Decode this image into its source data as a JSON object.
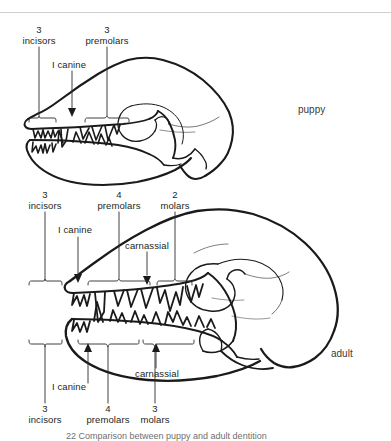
{
  "figure": {
    "top_rule_color": "#cfcfcf",
    "background_color": "#ffffff",
    "ink_color": "#1a1a1a"
  },
  "puppy": {
    "side_label": "puppy",
    "upper_labels": {
      "incisors_count": "3",
      "incisors_name": "incisors",
      "canine": "I canine",
      "premolars_count": "3",
      "premolars_name": "premolars"
    }
  },
  "adult": {
    "side_label": "adult",
    "upper_labels": {
      "incisors_count": "3",
      "incisors_name": "incisors",
      "canine": "I canine",
      "premolars_count": "4",
      "premolars_name": "premolars",
      "molars_count": "2",
      "molars_name": "molars",
      "carnassial": "carnassial"
    },
    "lower_labels": {
      "canine": "I canine",
      "carnassial": "carnassial",
      "incisors_count": "3",
      "incisors_name": "incisors",
      "premolars_count": "4",
      "premolars_name": "premolars",
      "molars_count": "3",
      "molars_name": "molars"
    }
  },
  "caption": {
    "text": "22 Comparison between puppy and adult dentition"
  }
}
